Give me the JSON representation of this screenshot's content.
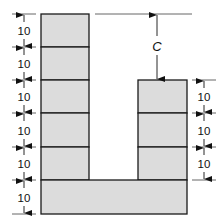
{
  "diagram": {
    "type": "stacked-block-layout",
    "fill_color": "#dcdcdc",
    "stroke_color": "#1a1a1a",
    "left_column": {
      "blocks": 5,
      "dimensions": [
        "10",
        "10",
        "10",
        "10",
        "10"
      ]
    },
    "base": {
      "blocks": 1,
      "dimension": "10"
    },
    "right_column": {
      "blocks": 3,
      "dimensions": [
        "10",
        "10",
        "10"
      ]
    },
    "left_dimension_labels": [
      "10",
      "10",
      "10",
      "10",
      "10",
      "10"
    ],
    "right_dimension_labels": [
      "10",
      "10",
      "10"
    ],
    "gap_label": "C"
  }
}
